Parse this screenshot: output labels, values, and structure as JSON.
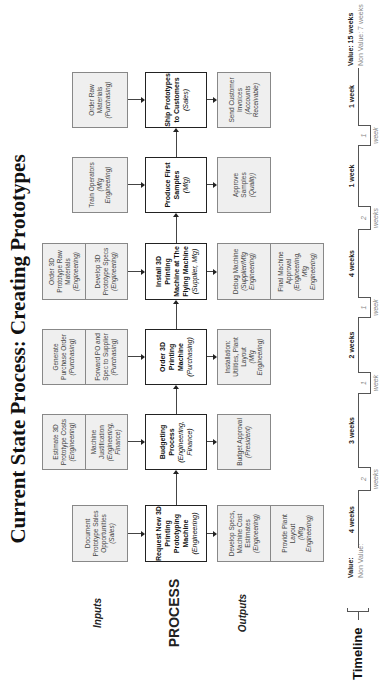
{
  "title": "Current State Process: Creating Prototypes",
  "row_labels": {
    "inputs": "Inputs",
    "process": "PROCESS",
    "outputs": "Outputs"
  },
  "steps": [
    {
      "process": {
        "name": "Request New 3D Printing Prototyping Machine",
        "role": "(Engineering)"
      },
      "inputs": [
        {
          "name": "Document Prototype Sales Opportunities",
          "role": "(Sales)"
        }
      ],
      "outputs": [
        {
          "name": "Develop Specs, Machine Cost Estimates",
          "role": "(Engineering)"
        },
        {
          "name": "Provide Plant Layout",
          "role": "(Mfg Engineering)"
        }
      ]
    },
    {
      "process": {
        "name": "Budgeting Process",
        "role": "(Engineering, Finance)"
      },
      "inputs": [
        {
          "name": "Estimate 3D Prototype Costs",
          "role": "(Engineering)"
        },
        {
          "name": "Machine Justification",
          "role": "(Engineering, Finance)"
        }
      ],
      "outputs": [
        {
          "name": "Budget Approval",
          "role": "(President)"
        }
      ]
    },
    {
      "process": {
        "name": "Order 3D Printing Machine",
        "role": "(Purchasing)"
      },
      "inputs": [
        {
          "name": "Generate Purchase Order",
          "role": "(Purchasing)"
        },
        {
          "name": "Forward PO and Spec to Supplier",
          "role": "(Purchasing)"
        }
      ],
      "outputs": [
        {
          "name": "Installation: Utilities, Plant Layout",
          "role": "(Mfg Engineering)"
        }
      ]
    },
    {
      "process": {
        "name": "Install 3D Printing Machine at The Flying Machine",
        "role": "(Supplier, Mfg)"
      },
      "inputs": [
        {
          "name": "Order 3D Prototype Raw Materials",
          "role": "(Engineering)"
        },
        {
          "name": "Develop 3D Prototype Specs",
          "role": "(Engineering)"
        }
      ],
      "outputs": [
        {
          "name": "Debug Machine",
          "role": "(Supplier/Mfg Engineering)"
        },
        {
          "name": "Final Machine Approval",
          "role": "(Engineering, Mfg Engineering)"
        }
      ]
    },
    {
      "process": {
        "name": "Produce First Samples",
        "role": "(Mfg)"
      },
      "inputs": [
        {
          "name": "Train Operators",
          "role": "(Mfg Engineering)"
        }
      ],
      "outputs": [
        {
          "name": "Approve Samples",
          "role": "(Quality)"
        }
      ]
    },
    {
      "process": {
        "name": "Ship Prototypes to Customers",
        "role": "(Sales)"
      },
      "inputs": [
        {
          "name": "Order Raw Materials",
          "role": "(Purchasing)"
        }
      ],
      "outputs": [
        {
          "name": "Send Customer Invoices",
          "role": "(Accounts Receivable)"
        }
      ]
    }
  ],
  "timeline": {
    "label": "Timeline",
    "value_key": "Value:",
    "non_value_key": "Non Value:",
    "value_segments": [
      "4 weeks",
      "3 weeks",
      "2 weeks",
      "4 weeks",
      "1 week",
      "1 week"
    ],
    "non_value_segments": [
      "2 weeks",
      "1 week",
      "1 week",
      "2 weeks",
      "1 week"
    ],
    "total_value": "Value: 15 weeks",
    "total_non_value": "Non Value: 7 weeks"
  }
}
